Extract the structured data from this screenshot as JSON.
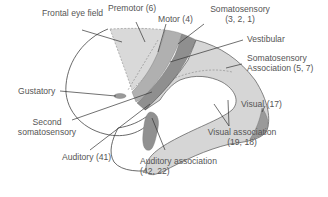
{
  "diagram": {
    "type": "brain-cortex-functional-areas",
    "labels": {
      "frontal_eye_field": "Frontal eye field",
      "premotor": "Premotor (6)",
      "motor": "Motor (4)",
      "somatosensory_l1": "Somatosensory",
      "somatosensory_l2": "(3, 2, 1)",
      "vestibular": "Vestibular",
      "somatosensory_assoc_l1": "Somatosensory",
      "somatosensory_assoc_l2": "Association (5, 7)",
      "gustatory": "Gustatory",
      "second_somatosensory_l1": "Second",
      "second_somatosensory_l2": "somatosensory",
      "visual": "Visual (17)",
      "visual_assoc_l1": "Visual association",
      "visual_assoc_l2": "(19, 18)",
      "auditory": "Auditory (41)",
      "auditory_assoc_l1": "Auditory association",
      "auditory_assoc_l2": "(42, 22)"
    },
    "colors": {
      "light_fill": "#d6d6d6",
      "mid_fill": "#a9a9a9",
      "dark_fill": "#8c8c8c",
      "outline": "#444444",
      "text": "#555555"
    }
  }
}
